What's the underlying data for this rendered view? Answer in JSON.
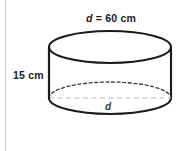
{
  "figure": {
    "type": "3d-cylinder-diagram",
    "shape_name": "cylinder",
    "background_color": "#ffffff",
    "outline_color": "#1b1b1b",
    "hidden_edge_color": "#3a3a3a",
    "axis_line_color": "#bdbdbd",
    "border_color": "#cfcfcf"
  },
  "labels": {
    "diameter_top": {
      "variable": "d",
      "equals": " = ",
      "value": "60 cm",
      "full_text": "d = 60 cm"
    },
    "height_left": {
      "value": "15 cm"
    },
    "diameter_bottom": {
      "variable": "d"
    }
  },
  "measurements": {
    "diameter_cm": 60,
    "height_cm": 15,
    "radius_cm": 30
  },
  "geometry": {
    "top_ellipse": {
      "cx": 110,
      "cy": 47,
      "rx": 61,
      "ry": 16
    },
    "bottom_ellipse": {
      "cx": 110,
      "cy": 98,
      "rx": 61,
      "ry": 16
    },
    "left_wall_x": 49,
    "right_wall_x": 171,
    "dashed_diameter_y": 98
  }
}
